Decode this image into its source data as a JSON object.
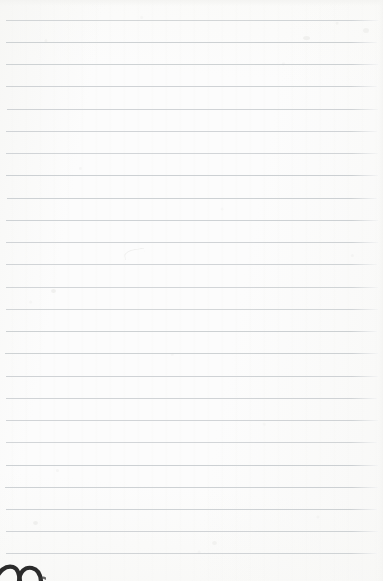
{
  "document": {
    "kind": "lined-notebook-paper-scan",
    "title": "Blank lined notebook page",
    "text_content": "",
    "is_blank": true,
    "orientation": "portrait",
    "width_px": 383,
    "height_px": 581
  },
  "paper": {
    "background_color": "#fcfcfc",
    "texture": "scanned paper grain",
    "edge_crop_note": "page is cropped at all four edges"
  },
  "ruling": {
    "style": "wide ruled horizontal lines",
    "line_color": "#c9cdd0",
    "line_thickness_px": 1,
    "line_count": 25,
    "first_line_y": 20,
    "line_spacing_px": 22.2,
    "line_left_x": 5,
    "line_right_x": 378,
    "margin_line_present": false,
    "lines_y": [
      20,
      42,
      64,
      86,
      109,
      131,
      153,
      175,
      198,
      220,
      242,
      264,
      287,
      309,
      331,
      353,
      376,
      398,
      420,
      442,
      465,
      487,
      509,
      531,
      553
    ],
    "line_left_offsets": [
      6,
      6,
      6,
      6,
      7,
      6,
      6,
      6,
      7,
      6,
      6,
      6,
      6,
      6,
      6,
      5,
      6,
      6,
      6,
      6,
      6,
      5,
      6,
      6,
      6
    ],
    "line_right_offsets": [
      378,
      377,
      378,
      377,
      378,
      377,
      378,
      378,
      377,
      378,
      378,
      377,
      378,
      378,
      377,
      378,
      378,
      377,
      378,
      377,
      378,
      378,
      377,
      378,
      377
    ]
  },
  "marks": [
    {
      "name": "ink-stroke-bottom-left",
      "description": "dark curved ink stroke entering from the bottom edge, partially cropped",
      "color": "#2b2b2b",
      "x": 0,
      "y": 562,
      "width": 46,
      "height": 19
    },
    {
      "name": "faint-pencil-trace",
      "description": "very faint light gray curved trace above a rule line",
      "color": "#e4e4e2",
      "x": 124,
      "y": 249,
      "width": 20,
      "height": 9
    },
    {
      "name": "smudge-upper-right",
      "description": "small pale smudge near the upper right",
      "color": "#f0f0ee",
      "x": 363,
      "y": 28,
      "width": 6,
      "height": 5
    },
    {
      "name": "smudge-mid-right",
      "description": "small pale smudge right of center",
      "color": "#efefed",
      "x": 303,
      "y": 36,
      "width": 7,
      "height": 4
    },
    {
      "name": "smudge-lower-left",
      "description": "small pale speck near the lower left",
      "color": "#eeeeec",
      "x": 33,
      "y": 521,
      "width": 5,
      "height": 4
    },
    {
      "name": "smudge-left-mid",
      "description": "small pale speck at left mid page",
      "color": "#efefed",
      "x": 51,
      "y": 289,
      "width": 5,
      "height": 4
    },
    {
      "name": "smudge-center-low",
      "description": "pale speck below center",
      "color": "#f1f1ef",
      "x": 212,
      "y": 541,
      "width": 5,
      "height": 4
    }
  ]
}
